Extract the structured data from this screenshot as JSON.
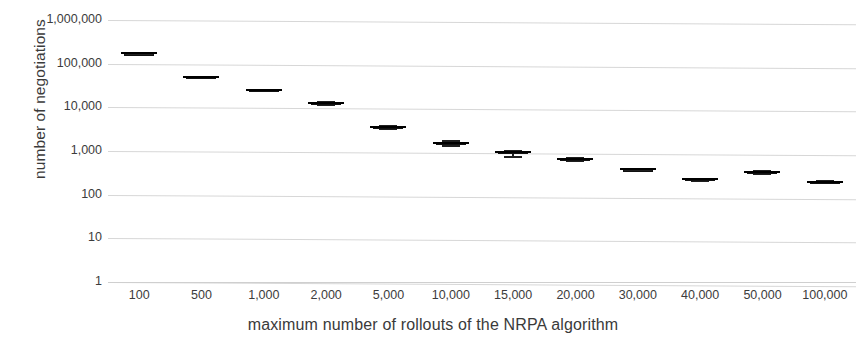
{
  "chart_data": {
    "type": "box",
    "title": "",
    "xlabel": "maximum number of rollouts of the NRPA algorithm",
    "ylabel": "number of negotiations",
    "yscale": "log",
    "ylim": [
      1,
      1000000
    ],
    "ytick_labels": [
      "1,000,000",
      "100,000",
      "10,000",
      "1,000",
      "100",
      "10",
      "1"
    ],
    "ytick_values": [
      1000000,
      100000,
      10000,
      1000,
      100,
      10,
      1
    ],
    "grid": true,
    "legend": "none",
    "categories": [
      "100",
      "500",
      "1,000",
      "2,000",
      "5,000",
      "10,000",
      "15,000",
      "20,000",
      "30,000",
      "40,000",
      "50,000",
      "100,000"
    ],
    "boxes": [
      {
        "category": "100",
        "whisker_low": 160000,
        "q1": 165000,
        "median": 172000,
        "q3": 180000,
        "whisker_high": 185000
      },
      {
        "category": "500",
        "whisker_low": 49000,
        "q1": 49500,
        "median": 50500,
        "q3": 52000,
        "whisker_high": 53000
      },
      {
        "category": "1,000",
        "whisker_low": 24000,
        "q1": 24500,
        "median": 25500,
        "q3": 26500,
        "whisker_high": 27000
      },
      {
        "category": "2,000",
        "whisker_low": 11500,
        "q1": 12000,
        "median": 12500,
        "q3": 13200,
        "whisker_high": 13800
      },
      {
        "category": "5,000",
        "whisker_low": 3200,
        "q1": 3350,
        "median": 3500,
        "q3": 3700,
        "whisker_high": 3900
      },
      {
        "category": "10,000",
        "whisker_low": 1350,
        "q1": 1430,
        "median": 1500,
        "q3": 1600,
        "whisker_high": 1750
      },
      {
        "category": "15,000",
        "whisker_low": 760,
        "q1": 910,
        "median": 950,
        "q3": 1010,
        "whisker_high": 1080
      },
      {
        "category": "20,000",
        "whisker_low": 590,
        "q1": 620,
        "median": 660,
        "q3": 700,
        "whisker_high": 730
      },
      {
        "category": "30,000",
        "whisker_low": 360,
        "q1": 370,
        "median": 385,
        "q3": 400,
        "whisker_high": 410
      },
      {
        "category": "40,000",
        "whisker_low": 215,
        "q1": 220,
        "median": 228,
        "q3": 238,
        "whisker_high": 245
      },
      {
        "category": "50,000",
        "whisker_low": 310,
        "q1": 320,
        "median": 333,
        "q3": 348,
        "whisker_high": 358
      },
      {
        "category": "100,000",
        "whisker_low": 188,
        "q1": 192,
        "median": 198,
        "q3": 206,
        "whisker_high": 212
      }
    ]
  }
}
